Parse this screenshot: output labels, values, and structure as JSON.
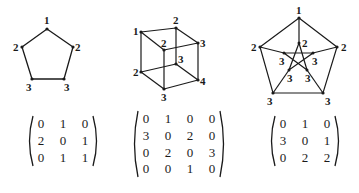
{
  "figures": [
    {
      "name": "pentagon",
      "vertex_labels": [
        "1",
        "2",
        "2",
        "3",
        "3"
      ],
      "matrix": [
        [
          "0",
          "1",
          "0"
        ],
        [
          "2",
          "0",
          "1"
        ],
        [
          "0",
          "1",
          "1"
        ]
      ]
    },
    {
      "name": "cube",
      "vertex_labels": [
        "1",
        "2",
        "2",
        "3",
        "2",
        "3",
        "3",
        "4"
      ],
      "matrix": [
        [
          "0",
          "1",
          "0",
          "0"
        ],
        [
          "3",
          "0",
          "2",
          "0"
        ],
        [
          "0",
          "2",
          "0",
          "3"
        ],
        [
          "0",
          "0",
          "1",
          "0"
        ]
      ]
    },
    {
      "name": "petersen",
      "vertex_labels": [
        "1",
        "2",
        "2",
        "3",
        "3",
        "2",
        "3",
        "3",
        "3",
        "3"
      ],
      "matrix": [
        [
          "0",
          "1",
          "0"
        ],
        [
          "3",
          "0",
          "1"
        ],
        [
          "0",
          "2",
          "2"
        ]
      ]
    }
  ],
  "colors": {
    "ink": "#1a1a1a",
    "background": "#ffffff"
  }
}
